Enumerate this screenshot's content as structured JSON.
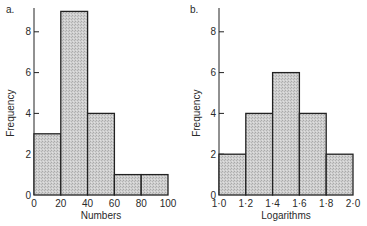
{
  "colors": {
    "bar_fill": "#c9c9c9",
    "stroke": "#222222",
    "text": "#2a2a2a"
  },
  "chart_data": [
    {
      "type": "bar",
      "panel_label": "a.",
      "title": "",
      "xlabel": "Numbers",
      "ylabel": "Frequency",
      "bin_edges": [
        0,
        20,
        40,
        60,
        80,
        100
      ],
      "x_tick_labels": [
        "0",
        "20",
        "40",
        "60",
        "80",
        "100"
      ],
      "categories": [
        "0-20",
        "20-40",
        "40-60",
        "60-80",
        "80-100"
      ],
      "values": [
        3,
        9,
        4,
        1,
        1
      ],
      "y_ticks": [
        0,
        2,
        4,
        6,
        8
      ],
      "y_tick_labels": [
        "0",
        "2",
        "4",
        "6",
        "8"
      ],
      "ylim": [
        0,
        9
      ],
      "grid": false,
      "legend": null
    },
    {
      "type": "bar",
      "panel_label": "b.",
      "title": "",
      "xlabel": "Logarithms",
      "ylabel": "Frequency",
      "bin_edges": [
        1.0,
        1.2,
        1.4,
        1.6,
        1.8,
        2.0
      ],
      "x_tick_labels": [
        "1·0",
        "1·2",
        "1·4",
        "1·6",
        "1·8",
        "2·0"
      ],
      "categories": [
        "1.0-1.2",
        "1.2-1.4",
        "1.4-1.6",
        "1.6-1.8",
        "1.8-2.0"
      ],
      "values": [
        2,
        4,
        6,
        4,
        2
      ],
      "y_ticks": [
        0,
        2,
        4,
        6,
        8
      ],
      "y_tick_labels": [
        "0",
        "2",
        "4",
        "6",
        "8"
      ],
      "ylim": [
        0,
        9
      ],
      "grid": false,
      "legend": null
    }
  ]
}
